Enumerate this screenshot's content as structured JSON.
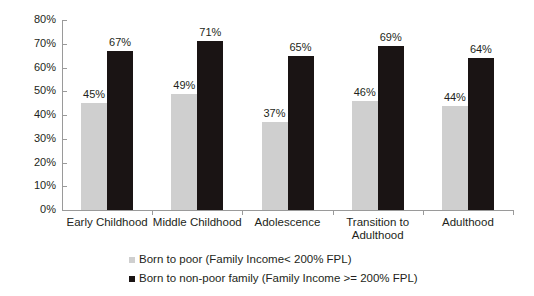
{
  "chart_data": {
    "type": "bar",
    "title": "",
    "subtitle": "",
    "xlabel": "",
    "ylabel": "",
    "ylim": [
      0,
      80
    ],
    "ytick_labels": [
      "0%",
      "10%",
      "20%",
      "30%",
      "40%",
      "50%",
      "60%",
      "70%",
      "80%"
    ],
    "ytick_values": [
      0,
      10,
      20,
      30,
      40,
      50,
      60,
      70,
      80
    ],
    "grid": false,
    "legend_position": "bottom-left",
    "categories": [
      "Early Childhood",
      "Middle Childhood",
      "Adolescence",
      "Transition to Adulthood",
      "Adulthood"
    ],
    "series": [
      {
        "name": "Born to poor (Family Income< 200% FPL)",
        "color": "#cfcfcf",
        "values": [
          45,
          49,
          37,
          46,
          44
        ],
        "data_labels": [
          "45%",
          "49%",
          "37%",
          "46%",
          "44%"
        ]
      },
      {
        "name": "Born to non-poor family (Family Income >= 200% FPL)",
        "color": "#1a1414",
        "values": [
          67,
          71,
          65,
          69,
          64
        ],
        "data_labels": [
          "67%",
          "71%",
          "65%",
          "69%",
          "64%"
        ]
      }
    ]
  },
  "legend": {
    "items": [
      {
        "label": "Born to poor (Family Income< 200% FPL)",
        "swatch": "series-poor"
      },
      {
        "label": "Born to non-poor family (Family Income >= 200% FPL)",
        "swatch": "series-nonpoor"
      }
    ]
  },
  "colors": {
    "series_poor": "#cfcfcf",
    "series_nonpoor": "#1a1414",
    "axis": "#9a9a9a",
    "text": "#231f20",
    "background": "#ffffff"
  }
}
